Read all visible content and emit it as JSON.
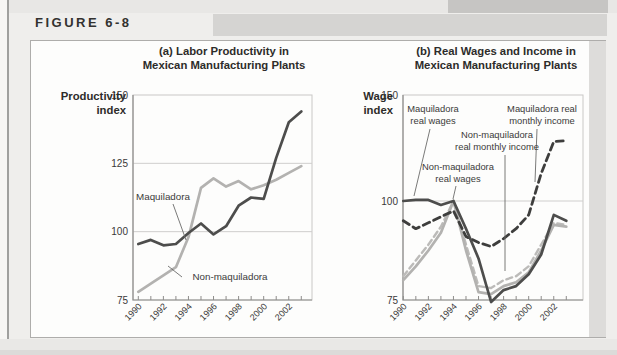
{
  "header": {
    "figure_label": "FIGURE 6-8"
  },
  "colors": {
    "line_dark": "#4d4d4c",
    "line_light": "#b3b2b0",
    "line_dark_dashed": "#3e3e3d",
    "line_light_dashed": "#bcbbb9",
    "grid": "#cfcecd",
    "frame": "#c9c8c6",
    "axis": "#8e8d8b",
    "tick_text": "#3a3938",
    "ann_text": "#3b3b3a",
    "leader": "#6b6b6a",
    "page_bg": "#efeeec",
    "panel_bg": "#fdfdfc"
  },
  "chart_data": [
    {
      "type": "line",
      "title_lines": [
        "(a) Labor Productivity in",
        "Mexican Manufacturing Plants"
      ],
      "y_axis_title_lines": [
        "Productivity",
        "index"
      ],
      "xlabel": "",
      "ylim": [
        75,
        150
      ],
      "y_ticks": [
        150,
        125,
        100,
        75
      ],
      "grid_values": [
        125,
        100
      ],
      "x": [
        1990,
        1991,
        1992,
        1993,
        1994,
        1995,
        1996,
        1997,
        1998,
        1999,
        2000,
        2001,
        2002,
        2003
      ],
      "x_tick_labels": [
        "1990",
        "1992",
        "1994",
        "1996",
        "1998",
        "2000",
        "2002"
      ],
      "x_label_indices": [
        0,
        2,
        4,
        6,
        8,
        10,
        12
      ],
      "series": [
        {
          "name": "Non-maquiladora",
          "style": "light-solid",
          "values": [
            78,
            81,
            84,
            87,
            98,
            116,
            119.5,
            116.5,
            118.5,
            115.5,
            117,
            119,
            121.5,
            124
          ]
        },
        {
          "name": "Maquiladora",
          "style": "dark-solid",
          "values": [
            95.5,
            97,
            95,
            95.5,
            99.5,
            103,
            99,
            102,
            109.5,
            112.5,
            112,
            127,
            140,
            144
          ]
        }
      ],
      "ann_font_size": 9.8,
      "ann_line_height": 12.5,
      "annotations": [
        {
          "text_lines": [
            "Maquiladora"
          ],
          "cx": 163,
          "y": 200,
          "leader": [
            173,
            204,
            186,
            240
          ]
        },
        {
          "text_lines": [
            "Non-maquiladora"
          ],
          "cx": 230,
          "y": 280,
          "leader": [
            182,
            277,
            168,
            266
          ]
        }
      ]
    },
    {
      "type": "line",
      "title_lines": [
        "(b) Real Wages and Income in",
        "Mexican Manufacturing Plants"
      ],
      "y_axis_title_lines": [
        "Wage",
        "index"
      ],
      "xlabel": "",
      "ylim": [
        75,
        150
      ],
      "y_axis_compressed_above": 100,
      "y_ticks": [
        150,
        100,
        75
      ],
      "grid_values": [
        100
      ],
      "x": [
        1990,
        1991,
        1992,
        1993,
        1994,
        1995,
        1996,
        1997,
        1998,
        1999,
        2000,
        2001,
        2002,
        2003
      ],
      "x_tick_labels": [
        "1990",
        "1992",
        "1994",
        "1996",
        "1998",
        "2000",
        "2002"
      ],
      "x_label_indices": [
        0,
        2,
        4,
        6,
        8,
        10,
        12
      ],
      "series": [
        {
          "name": "Non-maquiladora real monthly income",
          "style": "light-dashed",
          "values": [
            81,
            85,
            89,
            93.5,
            100,
            89,
            78.5,
            78,
            80,
            81,
            83.5,
            89,
            94.5,
            94
          ]
        },
        {
          "name": "Non-maquiladora real wages",
          "style": "light-solid",
          "values": [
            80,
            83.5,
            87.5,
            92,
            100,
            87.5,
            77,
            76.5,
            78.5,
            79.5,
            82,
            87.5,
            94,
            93.5
          ]
        },
        {
          "name": "Maquiladora real monthly income",
          "style": "dark-dashed",
          "values": [
            95,
            93,
            94.5,
            96,
            97.5,
            91,
            89.5,
            88.5,
            90.5,
            93,
            96.5,
            113,
            128,
            128.5
          ]
        },
        {
          "name": "Maquiladora real wages",
          "style": "dark-solid",
          "values": [
            100,
            100.5,
            100.5,
            99,
            100,
            93,
            85.5,
            74.5,
            77.5,
            78.5,
            81.5,
            86.5,
            96.5,
            95
          ]
        }
      ],
      "ann_font_size": 9.4,
      "ann_line_height": 12.3,
      "annotations": [
        {
          "text_lines": [
            "Maquiladora",
            "real wages"
          ],
          "cx": 433,
          "y": 112,
          "leader": [
            430,
            129,
            414,
            196
          ]
        },
        {
          "text_lines": [
            "Maquiladora real",
            "monthly income"
          ],
          "cx": 542,
          "y": 112,
          "leader": [
            537,
            129,
            535,
            182
          ]
        },
        {
          "text_lines": [
            "Non-maquiladora",
            "real monthly income"
          ],
          "cx": 497,
          "y": 138,
          "leader": [
            505,
            155,
            505,
            271
          ]
        },
        {
          "text_lines": [
            "Non-maquiladora",
            "real wages"
          ],
          "cx": 458,
          "y": 170,
          "leader": [
            456,
            186,
            453,
            199
          ]
        }
      ]
    }
  ]
}
